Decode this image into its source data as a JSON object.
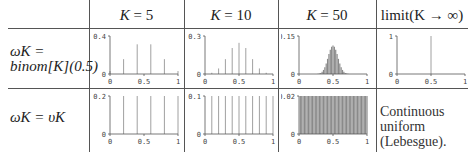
{
  "table": {
    "headers": [
      "K = 5",
      "K = 10",
      "K = 50",
      "limit(K → ∞)"
    ],
    "header_parts": [
      {
        "var": "K",
        "rest": " = 5"
      },
      {
        "var": "K",
        "rest": " = 10"
      },
      {
        "var": "K",
        "rest": " = 50"
      },
      {
        "var": "",
        "rest": "limit(K → ∞)"
      }
    ],
    "rows": [
      {
        "label_line1": "ωK =",
        "label_line2": "binom[K](0.5)"
      },
      {
        "label_line1": "ωK = υK"
      }
    ],
    "limit_uniform_note": [
      "Continuous",
      "uniform",
      "(Lebesgue)."
    ]
  },
  "chart_data": [
    {
      "type": "bar",
      "id": "binom-5",
      "row": "binomial",
      "K": 5,
      "ylim": [
        0,
        0.4
      ],
      "yticks": [
        "0",
        "0.4"
      ],
      "xticks": [
        "0",
        "0.5",
        "1"
      ],
      "x": [
        0,
        0.2,
        0.4,
        0.6,
        0.8,
        1.0
      ],
      "values": [
        0.03125,
        0.15625,
        0.3125,
        0.3125,
        0.15625,
        0.03125
      ]
    },
    {
      "type": "bar",
      "id": "binom-10",
      "row": "binomial",
      "K": 10,
      "ylim": [
        0,
        0.3
      ],
      "yticks": [
        "0",
        "0.3"
      ],
      "xticks": [
        "0",
        "0.5",
        "1"
      ],
      "x": [
        0,
        0.1,
        0.2,
        0.3,
        0.4,
        0.5,
        0.6,
        0.7,
        0.8,
        0.9,
        1.0
      ],
      "values": [
        0.001,
        0.0098,
        0.0439,
        0.1172,
        0.2051,
        0.2461,
        0.2051,
        0.1172,
        0.0439,
        0.0098,
        0.001
      ]
    },
    {
      "type": "bar",
      "id": "binom-50",
      "row": "binomial",
      "K": 50,
      "ylim": [
        0,
        0.15
      ],
      "yticks": [
        "0",
        "0.15"
      ],
      "xticks": [
        "0",
        "0.5",
        "1"
      ],
      "dist": "binomial",
      "n": 50,
      "p": 0.5
    },
    {
      "type": "bar",
      "id": "binom-limit",
      "row": "binomial",
      "K": "infinity",
      "ylim": [
        0,
        1
      ],
      "yticks": [
        "0",
        "1"
      ],
      "xticks": [
        "0",
        "0.5",
        "1"
      ],
      "x": [
        0.5
      ],
      "values": [
        1
      ]
    },
    {
      "type": "bar",
      "id": "uniform-5",
      "row": "uniform",
      "K": 5,
      "ylim": [
        0,
        0.2
      ],
      "yticks": [
        "0",
        "0.2"
      ],
      "xticks": [
        "0",
        "0.5",
        "1"
      ],
      "x": [
        0.2,
        0.4,
        0.6,
        0.8,
        1.0
      ],
      "values": [
        0.2,
        0.2,
        0.2,
        0.2,
        0.2
      ]
    },
    {
      "type": "bar",
      "id": "uniform-10",
      "row": "uniform",
      "K": 10,
      "ylim": [
        0,
        0.1
      ],
      "yticks": [
        "0",
        "0.1"
      ],
      "xticks": [
        "0",
        "0.5",
        "1"
      ],
      "x": [
        0.1,
        0.2,
        0.3,
        0.4,
        0.5,
        0.6,
        0.7,
        0.8,
        0.9,
        1.0
      ],
      "values": [
        0.1,
        0.1,
        0.1,
        0.1,
        0.1,
        0.1,
        0.1,
        0.1,
        0.1,
        0.1
      ]
    },
    {
      "type": "bar",
      "id": "uniform-50",
      "row": "uniform",
      "K": 50,
      "ylim": [
        0,
        0.02
      ],
      "yticks": [
        "0",
        "0.02"
      ],
      "xticks": [
        "0",
        "0.5",
        "1"
      ],
      "dist": "uniform",
      "n": 50,
      "value": 0.02
    }
  ],
  "colors": {
    "bar": "#999999",
    "axis": "#555555",
    "fill": "#aaaaaa"
  }
}
